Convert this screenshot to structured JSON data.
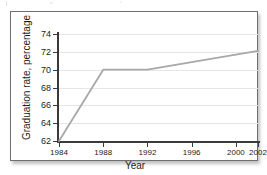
{
  "figure": {
    "axis_label_x": "Year",
    "axis_label_y": "Graduation rate, percentage"
  },
  "chart_data": {
    "type": "line",
    "title": "",
    "xlabel": "Year",
    "ylabel": "Graduation rate, percentage",
    "x": [
      1984,
      1988,
      1992,
      2002
    ],
    "values": [
      62.0,
      70.0,
      70.0,
      72.1
    ],
    "series": [
      {
        "name": "Graduation rate",
        "x": [
          1984,
          1988,
          1992,
          2002
        ],
        "values": [
          62.0,
          70.0,
          70.0,
          72.1
        ],
        "color": "#a8a8a8"
      }
    ],
    "xlim": [
      1984,
      2002
    ],
    "ylim": [
      62,
      74
    ],
    "xticks": [
      1984,
      1988,
      1992,
      1996,
      2000,
      2002
    ],
    "xtick_labels": [
      "1984",
      "1988",
      "1992",
      "1996",
      "2000",
      "2002"
    ],
    "yticks": [
      62,
      64,
      66,
      68,
      70,
      72,
      74
    ],
    "ytick_labels": [
      "62",
      "64",
      "66",
      "68",
      "70",
      "72",
      "74"
    ],
    "grid": "horizontal",
    "legend": "none",
    "line_color": "#a8a8a8",
    "axis_color": "#3a3a3a",
    "grid_color": "#e6e6e6"
  }
}
